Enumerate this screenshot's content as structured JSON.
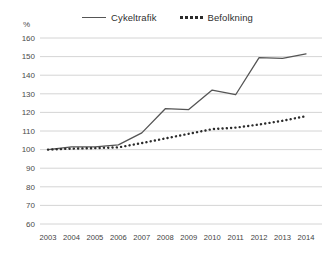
{
  "unit_label": "%",
  "legend": {
    "items": [
      {
        "label": "Cykeltrafik",
        "style": "solid",
        "color": "#555555"
      },
      {
        "label": "Befolkning",
        "style": "dotted",
        "color": "#2b2b2b"
      }
    ]
  },
  "chart_data": {
    "type": "line",
    "title": "",
    "subtitle": "",
    "xlabel": "",
    "ylabel": "%",
    "categories": [
      "2003",
      "2004",
      "2005",
      "2006",
      "2007",
      "2008",
      "2009",
      "2010",
      "2011",
      "2012",
      "2013",
      "2014"
    ],
    "x": [
      2003,
      2004,
      2005,
      2006,
      2007,
      2008,
      2009,
      2010,
      2011,
      2012,
      2013,
      2014
    ],
    "ylim": [
      60,
      160
    ],
    "yticks": [
      60,
      70,
      80,
      90,
      100,
      110,
      120,
      130,
      140,
      150,
      160
    ],
    "grid": true,
    "legend_position": "top-center",
    "series": [
      {
        "name": "Cykeltrafik",
        "style": "solid",
        "color": "#555555",
        "values": [
          100,
          101.5,
          101.5,
          102.5,
          109,
          122,
          121.5,
          132,
          129.5,
          149.5,
          149,
          151.5
        ]
      },
      {
        "name": "Befolkning",
        "style": "dotted",
        "color": "#2b2b2b",
        "values": [
          100,
          100.5,
          100.8,
          101.2,
          103.5,
          106,
          108.5,
          111,
          111.8,
          113.5,
          115.5,
          118
        ]
      }
    ]
  }
}
